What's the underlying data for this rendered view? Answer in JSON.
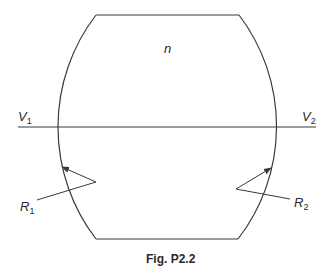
{
  "figure": {
    "caption": "Fig. P2.2",
    "medium_label": "n",
    "left_voltage": {
      "symbol": "V",
      "subscript": "1"
    },
    "right_voltage": {
      "symbol": "V",
      "subscript": "2"
    },
    "left_radius": {
      "symbol": "R",
      "subscript": "1"
    },
    "right_radius": {
      "symbol": "R",
      "subscript": "2"
    },
    "stroke_color": "#3a3a3a"
  }
}
